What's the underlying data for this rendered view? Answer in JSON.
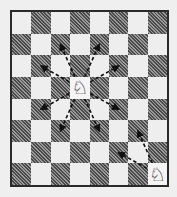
{
  "diagram": {
    "type": "chessboard",
    "files": 8,
    "ranks": 8,
    "top_left_color": "light",
    "colors": {
      "light": "#eeeeee",
      "dark": "#5a5a5a",
      "border": "#2a2a2a",
      "arrow": "#111111"
    },
    "pieces": [
      {
        "name": "white-knight",
        "glyph": "♘",
        "col": 3,
        "row": 3
      },
      {
        "name": "white-knight",
        "glyph": "♘",
        "col": 7,
        "row": 7
      }
    ],
    "moves": [
      {
        "from": [
          3,
          3
        ],
        "to": [
          1,
          2
        ]
      },
      {
        "from": [
          3,
          3
        ],
        "to": [
          2,
          1
        ]
      },
      {
        "from": [
          3,
          3
        ],
        "to": [
          4,
          1
        ]
      },
      {
        "from": [
          3,
          3
        ],
        "to": [
          5,
          2
        ]
      },
      {
        "from": [
          3,
          3
        ],
        "to": [
          1,
          4
        ]
      },
      {
        "from": [
          3,
          3
        ],
        "to": [
          2,
          5
        ]
      },
      {
        "from": [
          3,
          3
        ],
        "to": [
          4,
          5
        ]
      },
      {
        "from": [
          3,
          3
        ],
        "to": [
          5,
          4
        ]
      },
      {
        "from": [
          7,
          7
        ],
        "to": [
          6,
          5
        ]
      },
      {
        "from": [
          7,
          7
        ],
        "to": [
          5,
          6
        ]
      }
    ]
  }
}
